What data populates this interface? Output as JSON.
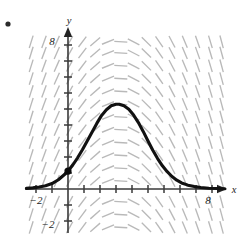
{
  "figure": {
    "kind": "slope-field-with-solution-curve",
    "background_color": "#ffffff",
    "corner_bullet": {
      "name": "bullet-marker",
      "x": 8,
      "y": 24,
      "radius": 2.6,
      "color": "#2b2b2b"
    }
  },
  "axes": {
    "x_label": "x",
    "y_label": "y",
    "axis_color": "#3a3a3a",
    "origin_px": {
      "x": 68,
      "y": 189
    },
    "unit_px": 16.0,
    "x_axis_px": {
      "start": 25,
      "end": 227
    },
    "y_axis_px": {
      "start": 233,
      "end": 27
    },
    "x_range": [
      -2.7,
      9.9
    ],
    "y_range": [
      -2.9,
      9.6
    ],
    "x_ticks": [
      -2,
      -1,
      1,
      2,
      3,
      4,
      5,
      6,
      7,
      8,
      9
    ],
    "y_ticks": [
      -2,
      -1,
      1,
      2,
      3,
      4,
      5,
      6,
      7,
      8,
      9
    ],
    "tick_half_length_px": 4
  },
  "tick_labels": [
    {
      "text": "-2",
      "axis": "x",
      "value": -2,
      "px_x": 36,
      "px_y": 204
    },
    {
      "text": "8",
      "axis": "x",
      "value": 8,
      "px_x": 208,
      "px_y": 204
    },
    {
      "text": "8",
      "axis": "y",
      "value": 8,
      "px_x": 52,
      "px_y": 45
    },
    {
      "text": "-2",
      "axis": "y",
      "value": -2,
      "px_x": 48,
      "px_y": 228
    }
  ],
  "chart_data": {
    "type": "line",
    "title": "",
    "xlabel": "x",
    "ylabel": "y",
    "xlim": [
      -2.7,
      9.9
    ],
    "ylim": [
      -2.9,
      9.6
    ],
    "grid": false,
    "legend": false,
    "series": [
      {
        "name": "particular solution",
        "color": "#111111",
        "linewidth": 3.1,
        "comment": "bell-shaped solution curve rising from near zero at left, peaking near x=3.2 at y=5.3, decaying to near zero by x=8.5",
        "x": [
          -2.6,
          -2.2,
          -1.8,
          -1.4,
          -1.0,
          -0.6,
          -0.2,
          0.0,
          0.3,
          0.6,
          0.9,
          1.2,
          1.5,
          1.8,
          2.1,
          2.4,
          2.7,
          3.0,
          3.2,
          3.5,
          3.8,
          4.1,
          4.4,
          4.7,
          5.0,
          5.3,
          5.6,
          5.9,
          6.2,
          6.5,
          6.8,
          7.1,
          7.5,
          7.9,
          8.3,
          8.8,
          9.3,
          9.8
        ],
        "y": [
          0.04,
          0.07,
          0.12,
          0.2,
          0.34,
          0.58,
          0.92,
          1.12,
          1.5,
          1.95,
          2.45,
          3.0,
          3.55,
          4.1,
          4.6,
          4.95,
          5.2,
          5.3,
          5.3,
          5.2,
          4.98,
          4.62,
          4.15,
          3.6,
          3.0,
          2.42,
          1.9,
          1.45,
          1.08,
          0.78,
          0.55,
          0.38,
          0.24,
          0.15,
          0.09,
          0.05,
          0.03,
          0.02
        ]
      }
    ],
    "annotations": [
      {
        "name": "initial-condition-point",
        "type": "point",
        "x": 0.0,
        "y": 1.12,
        "marker": "filled-circle",
        "radius_px": 3.6,
        "color": "#0d0d0d"
      }
    ],
    "slope_field": {
      "color": "#b9b9b9",
      "segment_length_px": 13,
      "x_samples": [
        -2.3,
        -1.5,
        -0.7,
        0.1,
        0.9,
        1.7,
        2.5,
        3.3,
        4.1,
        4.9,
        5.7,
        6.5,
        7.3,
        8.1,
        8.9,
        9.6
      ],
      "y_samples": [
        -2.4,
        -1.6,
        -0.8,
        0.5,
        1.3,
        2.1,
        2.9,
        3.7,
        4.5,
        5.3,
        6.1,
        6.9,
        7.7,
        8.5,
        9.2
      ],
      "slope_rule": "dy/dx proportional to (c - x) * y ; segments are near vertical far from centre-line x~3.2 and flatten to horizontal along it",
      "center_x": 3.2,
      "steepness": 0.58
    }
  }
}
